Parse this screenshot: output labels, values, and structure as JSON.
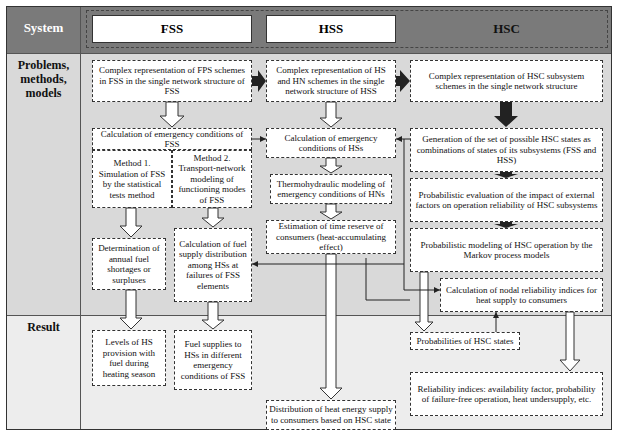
{
  "row_labels": {
    "system": "System",
    "problems": "Problems, methods, models",
    "result": "Result"
  },
  "systems": [
    {
      "id": "fss",
      "label": "FSS"
    },
    {
      "id": "hss",
      "label": "HSS"
    },
    {
      "id": "hsc",
      "label": "HSC"
    }
  ],
  "boxes": {
    "fss_complex": "Complex representation of FPS schemes in FSS in the single network structure of FSS",
    "fss_calc": "Calculation of emergency conditions of FSS",
    "fss_method1": "Method 1. Simulation of FSS by the statistical tests method",
    "fss_method2": "Method 2. Transport-network modeling of functioning modes of FSS",
    "fss_annual": "Determination of annual fuel shortages or surpluses",
    "fss_distribution": "Calculation of fuel supply distribution among HSs at failures of FSS elements",
    "fss_result_levels": "Levels of HS provision with fuel during heating season",
    "fss_result_supplies": "Fuel supplies to HSs in different emergency conditions of FSS",
    "hss_complex": "Complex representation of HS and HN schemes in the single network structure of HSS",
    "hss_calc": "Calculation of emergency conditions of HSs",
    "hss_thermo": "Thermohydraulic modeling of emergency conditions of HNs",
    "hss_time": "Estimation of time reserve of consumers (heat-accumulating effect)",
    "hss_result": "Distribution of heat energy supply to consumers based on HSC state",
    "hsc_complex": "Complex representation of HSC subsystem schemes in the single network structure",
    "hsc_generation": "Generation of the set of possible HSC states as combinations of states of its subsystems (FSS and HSS)",
    "hsc_probabilistic_eval": "Probabilistic evaluation of the impact of external factors on operation reliability of HSC subsystems",
    "hsc_markov": "Probabilistic modeling of HSC operation by the Markov process models",
    "hsc_nodal": "Calculation of nodal reliability indices for heat supply to consumers",
    "hsc_result_probs": "Probabilities of HSC states",
    "hsc_result_indices": "Reliability indices: availability factor, probability of failure-free operation, heat undersupply, etc."
  },
  "colors": {
    "header_band": "#7a7a7a",
    "middle_band": "#d9d9d9",
    "result_band": "#ededed",
    "box_fill": "#ffffff",
    "dark_arrow": "#222222"
  }
}
